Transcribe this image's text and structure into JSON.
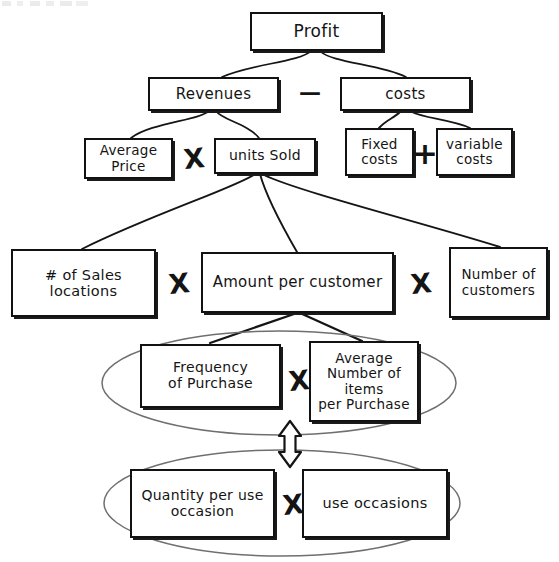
{
  "diagram": {
    "type": "hierarchical-driver-tree",
    "ink_color": "#141414",
    "background_color": "#ffffff",
    "nodes": [
      {
        "id": "profit",
        "label": "Profit",
        "level": 1
      },
      {
        "id": "revenues",
        "label": "Revenues",
        "level": 2
      },
      {
        "id": "costs",
        "label": "costs",
        "level": 2
      },
      {
        "id": "average-price",
        "label": "Average\nPrice",
        "level": 3
      },
      {
        "id": "units-sold",
        "label": "units Sold",
        "level": 3
      },
      {
        "id": "fixed-costs",
        "label": "Fixed\ncosts",
        "level": 3
      },
      {
        "id": "variable-costs",
        "label": "variable\ncosts",
        "level": 3
      },
      {
        "id": "sales-locations",
        "label": "# of Sales\nlocations",
        "level": 4
      },
      {
        "id": "amount-per-customer",
        "label": "Amount per customer",
        "level": 4
      },
      {
        "id": "number-customers",
        "label": "Number of\ncustomers",
        "level": 4
      },
      {
        "id": "frequency-purchase",
        "label": "Frequency\nof Purchase",
        "level": 5
      },
      {
        "id": "avg-items",
        "label": "Average\nNumber of\nitems\nper Purchase",
        "level": 5
      },
      {
        "id": "quantity-per-use",
        "label": "Quantity per use\noccasion",
        "level": 6
      },
      {
        "id": "use-occasions",
        "label": "use occasions",
        "level": 6
      }
    ],
    "operators": [
      {
        "id": "minus-revenues-costs",
        "symbol": "—",
        "kind": "minus",
        "between": [
          "revenues",
          "costs"
        ]
      },
      {
        "id": "times-price-units",
        "symbol": "X",
        "kind": "times",
        "between": [
          "average-price",
          "units-sold"
        ]
      },
      {
        "id": "plus-fixed-variable",
        "symbol": "+",
        "kind": "plus",
        "between": [
          "fixed-costs",
          "variable-costs"
        ]
      },
      {
        "id": "times-locations-amount",
        "symbol": "X",
        "kind": "times",
        "between": [
          "sales-locations",
          "amount-per-customer"
        ]
      },
      {
        "id": "times-amount-customers",
        "symbol": "X",
        "kind": "times",
        "between": [
          "amount-per-customer",
          "number-customers"
        ]
      },
      {
        "id": "times-frequency-items",
        "symbol": "X",
        "kind": "times",
        "between": [
          "frequency-purchase",
          "avg-items"
        ]
      },
      {
        "id": "times-quantity-occasions",
        "symbol": "X",
        "kind": "times",
        "between": [
          "quantity-per-use",
          "use-occasions"
        ]
      }
    ],
    "groupings": [
      {
        "id": "grouping-ellipse-upper",
        "shape": "ellipse",
        "encloses": [
          "frequency-purchase",
          "avg-items"
        ]
      },
      {
        "id": "grouping-ellipse-lower",
        "shape": "ellipse",
        "encloses": [
          "quantity-per-use",
          "use-occasions"
        ]
      }
    ],
    "connectors": [
      {
        "from": "profit",
        "to": "revenues"
      },
      {
        "from": "profit",
        "to": "costs"
      },
      {
        "from": "revenues",
        "to": "average-price"
      },
      {
        "from": "revenues",
        "to": "units-sold"
      },
      {
        "from": "costs",
        "to": "fixed-costs"
      },
      {
        "from": "costs",
        "to": "variable-costs"
      },
      {
        "from": "units-sold",
        "to": "sales-locations"
      },
      {
        "from": "units-sold",
        "to": "amount-per-customer"
      },
      {
        "from": "units-sold",
        "to": "number-customers"
      },
      {
        "from": "amount-per-customer",
        "to": "frequency-purchase"
      },
      {
        "from": "amount-per-customer",
        "to": "avg-items"
      }
    ],
    "equivalence_arrow": {
      "id": "double-headed-arrow",
      "direction": "vertical-both",
      "links": [
        "grouping-ellipse-upper",
        "grouping-ellipse-lower"
      ]
    }
  }
}
